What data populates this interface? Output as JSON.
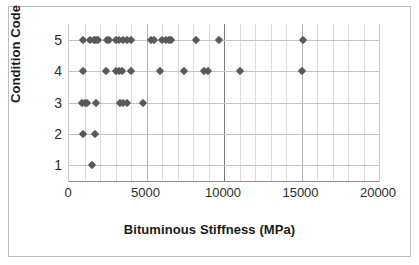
{
  "chart_data": {
    "type": "scatter",
    "title": "",
    "xlabel": "Bituminous Stiffness (MPa)",
    "ylabel": "Condition Code",
    "xlim": [
      0,
      20000
    ],
    "ylim": [
      0.5,
      5.5
    ],
    "xticks": [
      0,
      5000,
      10000,
      15000,
      20000
    ],
    "xtick_labels": [
      "0",
      "5000",
      "10000",
      "15000",
      "20000"
    ],
    "yticks": [
      1,
      2,
      3,
      4,
      5
    ],
    "ytick_labels": [
      "1",
      "2",
      "3",
      "4",
      "5"
    ],
    "grid": "vertical minor every 1000, horizontal at each condition code",
    "legend": "none",
    "marker": "diamond",
    "marker_color": "#595959",
    "series": [
      {
        "name": "Observations",
        "points": [
          [
            900,
            5
          ],
          [
            1350,
            5
          ],
          [
            1600,
            5
          ],
          [
            1750,
            5
          ],
          [
            1900,
            5
          ],
          [
            2450,
            5
          ],
          [
            2600,
            5
          ],
          [
            3050,
            5
          ],
          [
            3250,
            5
          ],
          [
            3500,
            5
          ],
          [
            3750,
            5
          ],
          [
            4000,
            5
          ],
          [
            5300,
            5
          ],
          [
            5500,
            5
          ],
          [
            6000,
            5
          ],
          [
            6250,
            5
          ],
          [
            6450,
            5
          ],
          [
            6600,
            5
          ],
          [
            8200,
            5
          ],
          [
            9700,
            5
          ],
          [
            15100,
            5
          ],
          [
            900,
            4
          ],
          [
            2400,
            4
          ],
          [
            3000,
            4
          ],
          [
            3250,
            4
          ],
          [
            3450,
            4
          ],
          [
            4000,
            4
          ],
          [
            5900,
            4
          ],
          [
            7450,
            4
          ],
          [
            8700,
            4
          ],
          [
            8950,
            4
          ],
          [
            11000,
            4
          ],
          [
            15050,
            4
          ],
          [
            850,
            3
          ],
          [
            1000,
            3
          ],
          [
            1150,
            3
          ],
          [
            1750,
            3
          ],
          [
            3300,
            3
          ],
          [
            3500,
            3
          ],
          [
            3750,
            3
          ],
          [
            4750,
            3
          ],
          [
            900,
            2
          ],
          [
            1700,
            2
          ],
          [
            1500,
            1
          ]
        ]
      }
    ]
  },
  "axes": {
    "x_title": "Bituminous Stiffness (MPa)",
    "y_title": "Condition Code"
  }
}
